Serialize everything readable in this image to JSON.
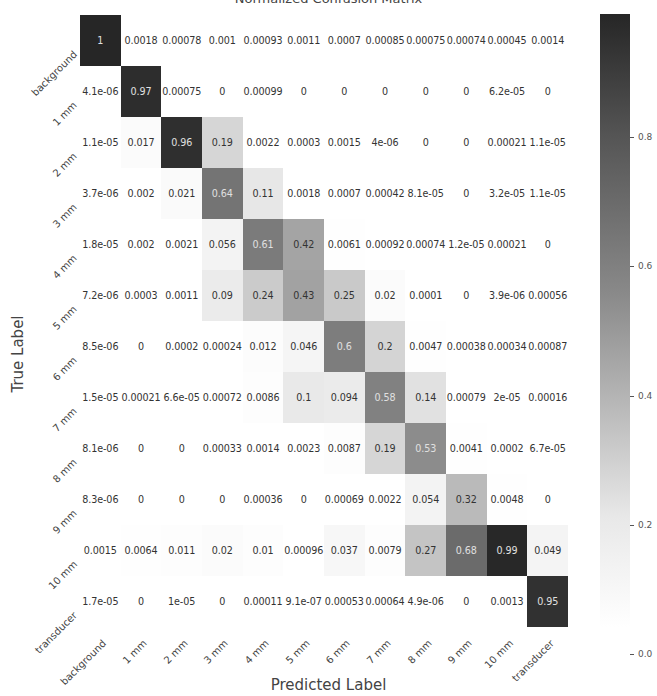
{
  "chart_data": {
    "type": "heatmap",
    "title": "Normalized Confusion Matrix",
    "xlabel": "Predicted Label",
    "ylabel": "True Label",
    "x_categories": [
      "background",
      "1 mm",
      "2 mm",
      "3 mm",
      "4 mm",
      "5 mm",
      "6 mm",
      "7 mm",
      "8 mm",
      "9 mm",
      "10 mm",
      "transducer"
    ],
    "y_categories": [
      "background",
      "1 mm",
      "2 mm",
      "3 mm",
      "4 mm",
      "5 mm",
      "6 mm",
      "7 mm",
      "8 mm",
      "9 mm",
      "10 mm",
      "transducer"
    ],
    "values": [
      [
        "1",
        "0.0018",
        "0.00078",
        "0.001",
        "0.00093",
        "0.0011",
        "0.0007",
        "0.00085",
        "0.00075",
        "0.00074",
        "0.00045",
        "0.0014"
      ],
      [
        "4.1e-06",
        "0.97",
        "0.00075",
        "0",
        "0.00099",
        "0",
        "0",
        "0",
        "0",
        "0",
        "6.2e-05",
        "0"
      ],
      [
        "1.1e-05",
        "0.017",
        "0.96",
        "0.19",
        "0.0022",
        "0.0003",
        "0.0015",
        "4e-06",
        "0",
        "0",
        "0.00021",
        "1.1e-05"
      ],
      [
        "3.7e-06",
        "0.002",
        "0.021",
        "0.64",
        "0.11",
        "0.0018",
        "0.0007",
        "0.00042",
        "8.1e-05",
        "0",
        "3.2e-05",
        "1.1e-05"
      ],
      [
        "1.8e-05",
        "0.002",
        "0.0021",
        "0.056",
        "0.61",
        "0.42",
        "0.0061",
        "0.00092",
        "0.00074",
        "1.2e-05",
        "0.00021",
        "0"
      ],
      [
        "7.2e-06",
        "0.0003",
        "0.0011",
        "0.09",
        "0.24",
        "0.43",
        "0.25",
        "0.02",
        "0.0001",
        "0",
        "3.9e-06",
        "0.00056"
      ],
      [
        "8.5e-06",
        "0",
        "0.0002",
        "0.00024",
        "0.012",
        "0.046",
        "0.6",
        "0.2",
        "0.0047",
        "0.00038",
        "0.00034",
        "0.00087"
      ],
      [
        "1.5e-05",
        "0.00021",
        "6.6e-05",
        "0.00072",
        "0.0086",
        "0.1",
        "0.094",
        "0.58",
        "0.14",
        "0.00079",
        "2e-05",
        "0.00016"
      ],
      [
        "8.1e-06",
        "0",
        "0",
        "0.00033",
        "0.0014",
        "0.0023",
        "0.0087",
        "0.19",
        "0.53",
        "0.0041",
        "0.0002",
        "6.7e-05"
      ],
      [
        "8.3e-06",
        "0",
        "0",
        "0",
        "0.00036",
        "0",
        "0.00069",
        "0.0022",
        "0.054",
        "0.32",
        "0.0048",
        "0"
      ],
      [
        "0.0015",
        "0.0064",
        "0.011",
        "0.02",
        "0.01",
        "0.00096",
        "0.037",
        "0.0079",
        "0.27",
        "0.68",
        "0.99",
        "0.049"
      ],
      [
        "1.7e-05",
        "0",
        "1e-05",
        "0",
        "0.00011",
        "9.1e-07",
        "0.00053",
        "0.00064",
        "4.9e-06",
        "0",
        "0.0013",
        "0.95"
      ]
    ],
    "colorbar": {
      "ticks": [
        "0.0",
        "0.2",
        "0.4",
        "0.6",
        "0.8"
      ],
      "range": [
        0,
        1
      ],
      "colormap": "Greys",
      "color_low": "#ffffff",
      "color_high": "#262626"
    },
    "grid": false,
    "legend": "colorbar-right"
  }
}
